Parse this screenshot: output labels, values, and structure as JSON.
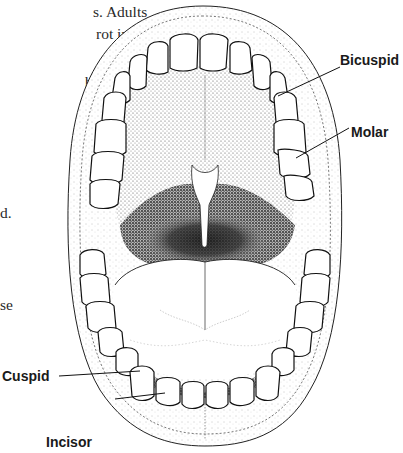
{
  "figure": {
    "labels": [
      {
        "id": "bicuspid",
        "text": "Bicuspid"
      },
      {
        "id": "molar",
        "text": "Molar"
      },
      {
        "id": "cuspid",
        "text": "Cuspid"
      },
      {
        "id": "incisor",
        "text": "Incisor"
      }
    ]
  },
  "text_fragments": [
    "s. Adults",
    "rot into",
    "bite and",
    "need to",
    "d.",
    "se"
  ],
  "colors": {
    "ink": "#1a1a1a",
    "paper": "#ffffff",
    "stipple": "#333333"
  }
}
